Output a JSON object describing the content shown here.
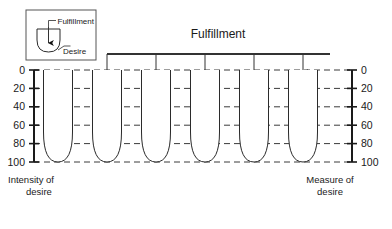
{
  "title": "Fulfillment",
  "legend": {
    "fulfillment_label": "Fulfillment",
    "desire_label": "Desire"
  },
  "axes": {
    "left_caption_line1": "Intensity of",
    "left_caption_line2": "desire",
    "right_caption_line1": "Measure of",
    "right_caption_line2": "desire",
    "ticks": [
      "0",
      "20",
      "40",
      "60",
      "80",
      "100"
    ],
    "tick_values": [
      0,
      20,
      40,
      60,
      80,
      100
    ],
    "min": 0,
    "max": 100
  },
  "colors": {
    "fill": "#d2d2d2",
    "outline": "#2b2b2b",
    "grid": "#3b3b3b",
    "text": "#1a1a1a",
    "background": "#ffffff"
  },
  "chart_data": {
    "type": "bar",
    "title": "Fulfillment",
    "xlabel": "",
    "ylabel": "Intensity of desire",
    "ylim": [
      0,
      100
    ],
    "y_inverted": true,
    "grid": true,
    "legend_position": "top-left",
    "categories": [
      "1",
      "2",
      "3",
      "4",
      "5",
      "6"
    ],
    "series": [
      {
        "name": "Fulfillment level",
        "values": [
          100,
          80,
          60,
          40,
          20,
          5
        ]
      }
    ],
    "annotations": [
      "Each vessel represents intensity of desire; shaded area shows fulfillment supplied from the manifold.",
      "Vessel 1 is unfilled (fulfillment 0); vessel 6 is nearly full."
    ],
    "vessels": [
      {
        "index": 1,
        "fill_level": 100,
        "filled": false,
        "has_arrow": false
      },
      {
        "index": 2,
        "fill_level": 80,
        "filled": true,
        "has_arrow": true
      },
      {
        "index": 3,
        "fill_level": 60,
        "filled": true,
        "has_arrow": true
      },
      {
        "index": 4,
        "fill_level": 40,
        "filled": true,
        "has_arrow": true
      },
      {
        "index": 5,
        "fill_level": 20,
        "filled": true,
        "has_arrow": true
      },
      {
        "index": 6,
        "fill_level": 5,
        "filled": true,
        "has_arrow": true
      }
    ]
  }
}
